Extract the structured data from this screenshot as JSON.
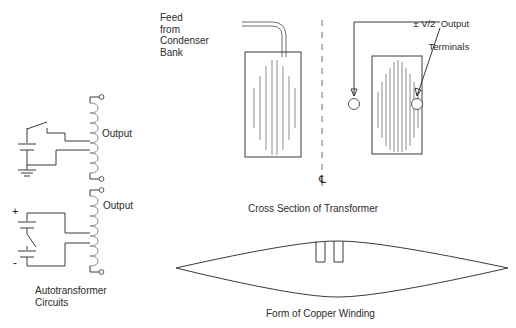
{
  "figure": {
    "title_implied": "Autotransformer circuits and transformer cross section",
    "labels": {
      "feed_from_condenser_bank": "Feed\nfrom\nCondenser\nBank",
      "output_upper": "Output",
      "output_lower": "Output",
      "autotransformer_circuits": "Autotransformer\nCircuits",
      "output_terminals_line1": "± V/2  Output",
      "output_terminals_line2": "Terminals",
      "cross_section_caption": "Cross Section of Transformer",
      "copper_winding_caption": "Form of Copper Winding",
      "polarity_plus": "+",
      "polarity_minus": "-",
      "centerline_symbol": "℄"
    },
    "colors": {
      "line_dark": "#3a3a3a",
      "line_gray": "#8c8c8c",
      "line_mid": "#6e6e6e",
      "background": "#ffffff",
      "text": "#2b2b2b"
    },
    "panels": [
      {
        "name": "autotransformer-circuits",
        "caption": "Autotransformer\nCircuits"
      },
      {
        "name": "cross-section-of-transformer",
        "caption": "Cross Section of Transformer"
      },
      {
        "name": "form-of-copper-winding",
        "caption": "Form of Copper Winding"
      }
    ],
    "circuits": [
      {
        "name": "upper-autotransformer-circuit",
        "elements": [
          "switch",
          "capacitor",
          "ground",
          "coil",
          "tap",
          "output-terminal-top",
          "output-terminal-bottom"
        ],
        "output_label": "Output"
      },
      {
        "name": "lower-autotransformer-circuit",
        "elements": [
          "capacitor-upper",
          "switch",
          "capacitor-lower",
          "coil",
          "tap",
          "output-terminal-top",
          "output-terminal-bottom"
        ],
        "polarity_top": "+",
        "polarity_bottom": "-",
        "output_label": "Output"
      }
    ],
    "cross_section": {
      "left_half": {
        "name": "left-transformer-half",
        "winding_line_count": 8,
        "feed_lead": "curved-twin-lead-entering-top"
      },
      "right_half": {
        "name": "right-transformer-half",
        "winding_line_count": 11,
        "terminal_count": 2
      },
      "centerline": "dashed-vertical-centerline"
    },
    "copper_winding": {
      "shape": "flattened-lens",
      "tab_count": 2
    }
  }
}
